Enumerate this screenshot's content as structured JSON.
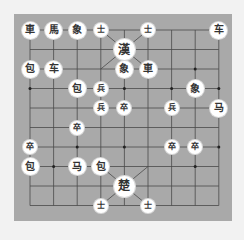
{
  "board": {
    "cols": 9,
    "rows": 10,
    "grid_x": [
      30,
      53.6,
      77.2,
      100.8,
      124.4,
      148,
      171.6,
      195.2,
      218.8
    ],
    "grid_y": [
      30,
      49.5,
      69,
      88.5,
      108,
      127.5,
      147,
      166.5,
      186,
      205.5
    ],
    "line_color": "#4a4a4a",
    "background": "#a9a9a9"
  },
  "pieces": [
    {
      "char": "車",
      "col": 0,
      "row": 0,
      "kind": "chariot"
    },
    {
      "char": "馬",
      "col": 1,
      "row": 0,
      "kind": "horse"
    },
    {
      "char": "象",
      "col": 2,
      "row": 0,
      "kind": "elephant"
    },
    {
      "char": "士",
      "col": 3,
      "row": 0,
      "kind": "advisor"
    },
    {
      "char": "士",
      "col": 5,
      "row": 0,
      "kind": "advisor"
    },
    {
      "char": "车",
      "col": 8,
      "row": 0,
      "kind": "chariot"
    },
    {
      "char": "漢",
      "col": 4,
      "row": 1,
      "kind": "general"
    },
    {
      "char": "包",
      "col": 0,
      "row": 2,
      "kind": "cannon"
    },
    {
      "char": "车",
      "col": 1,
      "row": 2,
      "kind": "chariot"
    },
    {
      "char": "象",
      "col": 4,
      "row": 2,
      "kind": "elephant"
    },
    {
      "char": "車",
      "col": 5,
      "row": 2,
      "kind": "chariot"
    },
    {
      "char": "包",
      "col": 2,
      "row": 3,
      "kind": "cannon"
    },
    {
      "char": "兵",
      "col": 3,
      "row": 3,
      "kind": "soldier"
    },
    {
      "char": "象",
      "col": 7,
      "row": 3,
      "kind": "elephant"
    },
    {
      "char": "兵",
      "col": 3,
      "row": 4,
      "kind": "soldier"
    },
    {
      "char": "卒",
      "col": 4,
      "row": 4,
      "kind": "soldier"
    },
    {
      "char": "兵",
      "col": 6,
      "row": 4,
      "kind": "soldier"
    },
    {
      "char": "马",
      "col": 8,
      "row": 4,
      "kind": "horse"
    },
    {
      "char": "卒",
      "col": 2,
      "row": 5,
      "kind": "soldier"
    },
    {
      "char": "卒",
      "col": 0,
      "row": 6,
      "kind": "soldier"
    },
    {
      "char": "卒",
      "col": 6,
      "row": 6,
      "kind": "soldier"
    },
    {
      "char": "卒",
      "col": 7,
      "row": 6,
      "kind": "soldier"
    },
    {
      "char": "包",
      "col": 0,
      "row": 7,
      "kind": "cannon"
    },
    {
      "char": "马",
      "col": 2,
      "row": 7,
      "kind": "horse"
    },
    {
      "char": "包",
      "col": 3,
      "row": 7,
      "kind": "cannon"
    },
    {
      "char": "楚",
      "col": 4,
      "row": 8,
      "kind": "general"
    },
    {
      "char": "士",
      "col": 3,
      "row": 9,
      "kind": "advisor"
    },
    {
      "char": "士",
      "col": 5,
      "row": 9,
      "kind": "advisor"
    }
  ]
}
